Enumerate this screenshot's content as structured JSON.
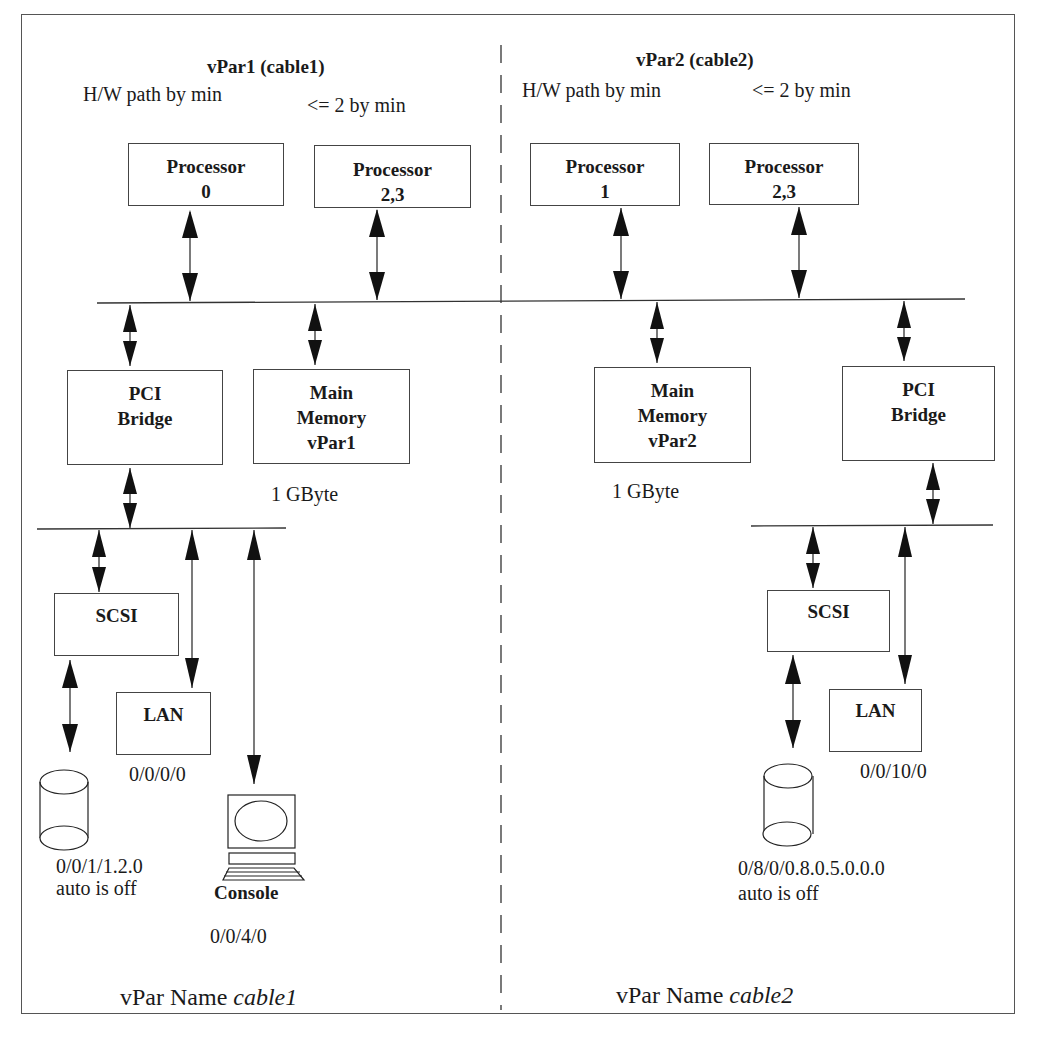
{
  "diagram": {
    "type": "hardware partition diagram",
    "divider_style": "dashed vertical line",
    "partitions": [
      {
        "id": "vpar1",
        "title": "vPar1 (cable1)",
        "note_left": "H/W path by min",
        "note_right": "<= 2 by min",
        "processors": [
          {
            "name": "Processor",
            "id": "0"
          },
          {
            "name": "Processor",
            "id": "2,3"
          }
        ],
        "pci_bridge": {
          "line1": "PCI",
          "line2": "Bridge"
        },
        "memory": {
          "line1": "Main",
          "line2": "Memory",
          "line3": "vPar1",
          "size": "1 GByte"
        },
        "scsi": {
          "label": "SCSI"
        },
        "lan": {
          "label": "LAN",
          "path": "0/0/0/0"
        },
        "disk": {
          "path": "0/0/1/1.2.0",
          "status": "auto is off"
        },
        "console": {
          "label": "Console",
          "path": "0/0/4/0"
        },
        "vpar_name_prefix": "vPar Name ",
        "vpar_name": "cable1"
      },
      {
        "id": "vpar2",
        "title": "vPar2 (cable2)",
        "note_left": "H/W path by min",
        "note_right": "<= 2 by min",
        "processors": [
          {
            "name": "Processor",
            "id": "1"
          },
          {
            "name": "Processor",
            "id": "2,3"
          }
        ],
        "pci_bridge": {
          "line1": "PCI",
          "line2": "Bridge"
        },
        "memory": {
          "line1": "Main",
          "line2": "Memory",
          "line3": "vPar2",
          "size": "1 GByte"
        },
        "scsi": {
          "label": "SCSI"
        },
        "lan": {
          "label": "LAN",
          "path": "0/0/10/0"
        },
        "disk": {
          "path": "0/8/0/0.8.0.5.0.0.0",
          "status": "auto is off"
        },
        "vpar_name_prefix": "vPar Name ",
        "vpar_name": "cable2"
      }
    ],
    "colors": {
      "line": "#333333",
      "box_border": "#444444",
      "background": "#ffffff",
      "text": "#1a1a1a"
    }
  }
}
